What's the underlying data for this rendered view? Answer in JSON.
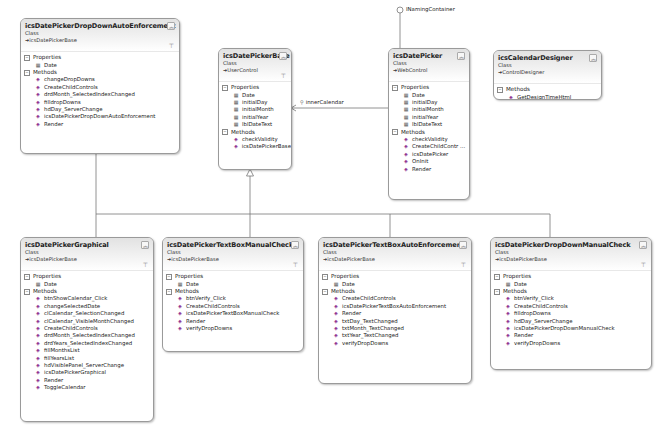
{
  "diagram": {
    "type": "class-diagram",
    "classes": [
      {
        "id": "dropdown-auto",
        "name": "icsDatePickerDropDownAutoEnforcement",
        "kind": "Class",
        "base": "icsDatePickerBase",
        "properties_label": "Properties",
        "methods_label": "Methods",
        "properties": [
          "Date"
        ],
        "methods": [
          "changeDropDowns",
          "CreateChildControls",
          "drdMonth_SelectedIndexChanged",
          "filldropDowns",
          "hdDay_ServerChange",
          "icsDatePickerDropDownAutoEnforcement",
          "Render"
        ]
      },
      {
        "id": "base",
        "name": "icsDatePickerBase",
        "kind": "Class",
        "base": "UserControl",
        "properties_label": "Properties",
        "methods_label": "Methods",
        "properties": [
          "Date",
          "initialDay",
          "initialMonth",
          "initialYear",
          "lblDateText"
        ],
        "methods": [
          "checkValidity",
          "icsDatePickerBase"
        ]
      },
      {
        "id": "picker",
        "name": "icsDatePicker",
        "kind": "Class",
        "base": "WebControl",
        "interface": "INamingContainer",
        "properties_label": "Properties",
        "methods_label": "Methods",
        "properties": [
          "Date",
          "initialDay",
          "initialMonth",
          "initialYear",
          "lblDateText"
        ],
        "methods": [
          "checkValidity",
          "CreateChildContr ...",
          "icsDatePicker",
          "OnInit",
          "Render"
        ]
      },
      {
        "id": "designer",
        "name": "icsCalendarDesigner",
        "kind": "Class",
        "base": "ControlDesigner",
        "methods_label": "Methods",
        "methods": [
          "GetDesignTimeHtml"
        ]
      },
      {
        "id": "graphical",
        "name": "icsDatePickerGraphical",
        "kind": "Class",
        "base": "icsDatePickerBase",
        "properties_label": "Properties",
        "methods_label": "Methods",
        "properties": [
          "Date"
        ],
        "methods": [
          "btnShowCalendar_Click",
          "changeSelectedDate",
          "clCalendar_SelectionChanged",
          "clCalendar_VisibleMonthChanged",
          "CreateChildControls",
          "drdMonth_SelectedIndexChanged",
          "drdYears_SelectedIndexChanged",
          "fillMonthsList",
          "fillYearsList",
          "hdVisiblePanel_ServerChange",
          "icsDatePickerGraphical",
          "Render",
          "ToggleCalendar"
        ]
      },
      {
        "id": "textbox-manual",
        "name": "icsDatePickerTextBoxManualCheck",
        "kind": "Class",
        "base": "icsDatePickerBase",
        "properties_label": "Properties",
        "methods_label": "Methods",
        "properties": [
          "Date"
        ],
        "methods": [
          "btnVerify_Click",
          "CreateChildControls",
          "icsDatePickerTextBoxManualCheck",
          "Render",
          "verifyDropDowns"
        ]
      },
      {
        "id": "textbox-auto",
        "name": "icsDatePickerTextBoxAutoEnforcement",
        "kind": "Class",
        "base": "icsDatePickerBase",
        "properties_label": "Properties",
        "methods_label": "Methods",
        "properties": [
          "Date"
        ],
        "methods": [
          "CreateChildControls",
          "icsDatePickerTextBoxAutoEnforcement",
          "Render",
          "txtDay_TextChanged",
          "txtMonth_TextChanged",
          "txtYear_TextChanged",
          "verifyDropDowns"
        ]
      },
      {
        "id": "dropdown-manual",
        "name": "icsDatePickerDropDownManualCheck",
        "kind": "Class",
        "base": "icsDatePickerBase",
        "properties_label": "Properties",
        "methods_label": "Methods",
        "properties": [
          "Date"
        ],
        "methods": [
          "btnVerify_Click",
          "CreateChildControls",
          "filldropDowns",
          "hdDay_ServerChange",
          "icsDatePickerDropDownManualCheck",
          "Render",
          "verifyDropDowns"
        ]
      }
    ],
    "associations": [
      {
        "from": "icsDatePicker",
        "to": "icsDatePickerBase",
        "label": "innerCalendar"
      }
    ],
    "interfaces": [
      {
        "name": "INamingContainer",
        "on": "icsDatePicker"
      }
    ],
    "icons": {
      "collapse": "double-chevron-up-icon",
      "filter": "filter-icon",
      "property": "property-icon",
      "method": "method-icon",
      "section_toggle": "minus-box-icon"
    }
  }
}
